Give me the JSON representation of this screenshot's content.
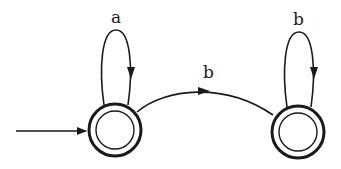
{
  "diagram": {
    "type": "finite-automaton",
    "states": [
      {
        "id": "q0",
        "initial": true,
        "accepting": true
      },
      {
        "id": "q1",
        "initial": false,
        "accepting": true
      }
    ],
    "transitions": [
      {
        "from": "q0",
        "to": "q0",
        "label": "a"
      },
      {
        "from": "q0",
        "to": "q1",
        "label": "b"
      },
      {
        "from": "q1",
        "to": "q1",
        "label": "b"
      }
    ],
    "colors": {
      "stroke": "#1a1a1a",
      "background": "#ffffff"
    }
  }
}
